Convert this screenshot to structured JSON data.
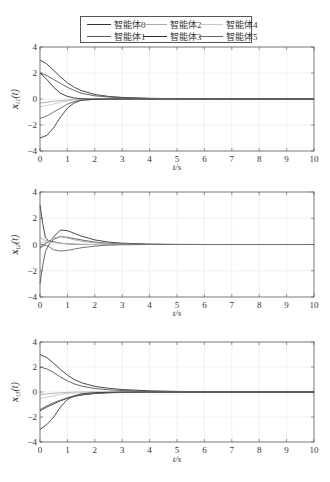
{
  "legend": {
    "items": [
      {
        "label": "智能体0",
        "color": "#333333"
      },
      {
        "label": "智能体1",
        "color": "#555555"
      },
      {
        "label": "智能体2",
        "color": "#aaaaaa"
      },
      {
        "label": "智能体3",
        "color": "#2a2a2a"
      },
      {
        "label": "智能体4",
        "color": "#c8c8c8"
      },
      {
        "label": "智能体5",
        "color": "#666666"
      }
    ]
  },
  "chart_data": [
    {
      "type": "line",
      "title": "",
      "xlabel": "t/s",
      "ylabel": "x_i1(t)",
      "xlim": [
        0,
        10
      ],
      "ylim": [
        -4,
        4
      ],
      "xticks": [
        0,
        1,
        2,
        3,
        4,
        5,
        6,
        7,
        8,
        9,
        10
      ],
      "yticks": [
        -4,
        -2,
        0,
        2,
        4
      ],
      "grid": true,
      "legend_position": "top-center (shared)",
      "x": [
        0,
        0.25,
        0.5,
        0.75,
        1,
        1.25,
        1.5,
        2,
        2.5,
        3,
        4,
        5,
        6,
        7,
        8,
        10
      ],
      "series": [
        {
          "name": "智能体0",
          "values": [
            3.0,
            2.7,
            2.2,
            1.7,
            1.25,
            0.9,
            0.65,
            0.35,
            0.2,
            0.12,
            0.05,
            0.02,
            0.01,
            0,
            0,
            0
          ]
        },
        {
          "name": "智能体1",
          "values": [
            2.0,
            1.8,
            1.5,
            1.2,
            0.9,
            0.65,
            0.45,
            0.25,
            0.15,
            0.09,
            0.04,
            0.02,
            0.01,
            0,
            0,
            0
          ]
        },
        {
          "name": "智能体2",
          "values": [
            -0.3,
            -0.25,
            -0.18,
            -0.12,
            -0.07,
            -0.04,
            -0.02,
            0,
            0,
            0,
            0,
            0,
            0,
            0,
            0,
            0
          ]
        },
        {
          "name": "智能体3",
          "values": [
            2.0,
            1.5,
            0.9,
            0.45,
            0.2,
            0.08,
            0.02,
            0,
            0,
            0,
            0,
            0,
            0,
            0,
            0,
            0
          ]
        },
        {
          "name": "智能体4",
          "values": [
            -0.6,
            -0.5,
            -0.38,
            -0.25,
            -0.15,
            -0.08,
            -0.04,
            -0.01,
            0,
            0,
            0,
            0,
            0,
            0,
            0,
            0
          ]
        },
        {
          "name": "智能体5",
          "values": [
            -1.5,
            -1.3,
            -1.0,
            -0.7,
            -0.4,
            -0.2,
            -0.08,
            -0.02,
            0,
            0,
            0,
            0,
            0,
            0,
            0,
            0
          ]
        },
        {
          "name": "extra",
          "values": [
            -3.0,
            -2.8,
            -2.2,
            -1.4,
            -0.7,
            -0.3,
            -0.1,
            -0.02,
            0,
            0,
            0,
            0,
            0,
            0,
            0,
            0
          ]
        }
      ]
    },
    {
      "type": "line",
      "title": "",
      "xlabel": "t/s",
      "ylabel": "x_i2(t)",
      "xlim": [
        0,
        10
      ],
      "ylim": [
        -4,
        4
      ],
      "xticks": [
        0,
        1,
        2,
        3,
        4,
        5,
        6,
        7,
        8,
        9,
        10
      ],
      "yticks": [
        -4,
        -2,
        0,
        2,
        4
      ],
      "grid": true,
      "x": [
        0,
        0.1,
        0.2,
        0.35,
        0.5,
        0.75,
        1,
        1.25,
        1.5,
        2,
        2.5,
        3,
        4,
        5,
        6,
        8,
        10
      ],
      "series": [
        {
          "name": "智能体0",
          "values": [
            3.0,
            1.6,
            0.5,
            0.2,
            0.6,
            1.1,
            1.05,
            0.85,
            0.65,
            0.35,
            0.18,
            0.1,
            0.03,
            0.01,
            0,
            0,
            0
          ]
        },
        {
          "name": "智能体1",
          "values": [
            -3.0,
            -1.6,
            -0.5,
            0.1,
            0.4,
            0.6,
            0.55,
            0.45,
            0.35,
            0.18,
            0.09,
            0.05,
            0.01,
            0,
            0,
            0,
            0
          ]
        },
        {
          "name": "智能体2",
          "values": [
            0.5,
            0.4,
            0.3,
            0.3,
            0.5,
            0.6,
            0.5,
            0.35,
            0.25,
            0.12,
            0.05,
            0.02,
            0,
            0,
            0,
            0,
            0
          ]
        },
        {
          "name": "智能体3",
          "values": [
            -0.3,
            -0.1,
            0.1,
            0.25,
            0.2,
            0.1,
            0.05,
            0.02,
            0.01,
            0,
            0,
            0,
            0,
            0,
            0,
            0,
            0
          ]
        },
        {
          "name": "智能体4",
          "values": [
            0.1,
            0.15,
            0.2,
            0.2,
            0.15,
            0.1,
            0.05,
            0.02,
            0.01,
            0,
            0,
            0,
            0,
            0,
            0,
            0,
            0
          ]
        },
        {
          "name": "智能体5",
          "values": [
            -0.2,
            -0.1,
            -0.05,
            -0.2,
            -0.4,
            -0.5,
            -0.45,
            -0.35,
            -0.25,
            -0.12,
            -0.05,
            -0.02,
            0,
            0,
            0,
            0,
            0
          ]
        }
      ]
    },
    {
      "type": "line",
      "title": "",
      "xlabel": "t/s",
      "ylabel": "x_i3(t)",
      "xlim": [
        0,
        10
      ],
      "ylim": [
        -4,
        4
      ],
      "xticks": [
        0,
        1,
        2,
        3,
        4,
        5,
        6,
        7,
        8,
        9,
        10
      ],
      "yticks": [
        -4,
        -2,
        0,
        2,
        4
      ],
      "grid": true,
      "x": [
        0,
        0.25,
        0.5,
        0.75,
        1,
        1.25,
        1.5,
        2,
        2.5,
        3,
        4,
        5,
        6,
        7,
        8,
        10
      ],
      "series": [
        {
          "name": "智能体0",
          "values": [
            3.0,
            2.75,
            2.3,
            1.8,
            1.35,
            1.0,
            0.75,
            0.45,
            0.3,
            0.2,
            0.1,
            0.05,
            0.02,
            0.01,
            0,
            0
          ]
        },
        {
          "name": "智能体1",
          "values": [
            2.0,
            1.85,
            1.55,
            1.2,
            0.9,
            0.65,
            0.48,
            0.28,
            0.18,
            0.12,
            0.05,
            0.02,
            0.01,
            0,
            0,
            0
          ]
        },
        {
          "name": "智能体2",
          "values": [
            -0.2,
            -0.15,
            -0.1,
            -0.06,
            -0.03,
            -0.01,
            0,
            0,
            0,
            0,
            0,
            0,
            0,
            0,
            0,
            0
          ]
        },
        {
          "name": "智能体3",
          "values": [
            -1.5,
            -1.2,
            -0.95,
            -0.7,
            -0.5,
            -0.35,
            -0.25,
            -0.12,
            -0.06,
            -0.03,
            0,
            0,
            0,
            0,
            0,
            0
          ]
        },
        {
          "name": "智能体4",
          "values": [
            -0.5,
            -0.4,
            -0.3,
            -0.2,
            -0.13,
            -0.08,
            -0.05,
            -0.02,
            0,
            0,
            0,
            0,
            0,
            0,
            0,
            0
          ]
        },
        {
          "name": "智能体5",
          "values": [
            -1.4,
            -1.1,
            -0.85,
            -0.65,
            -0.45,
            -0.32,
            -0.22,
            -0.1,
            -0.05,
            -0.02,
            0,
            0,
            0,
            0,
            0,
            0
          ]
        },
        {
          "name": "extra",
          "values": [
            -3.0,
            -2.6,
            -2.0,
            -1.2,
            -0.6,
            -0.3,
            -0.15,
            -0.05,
            -0.02,
            0,
            0,
            0,
            0,
            0,
            0,
            0
          ]
        }
      ]
    }
  ]
}
